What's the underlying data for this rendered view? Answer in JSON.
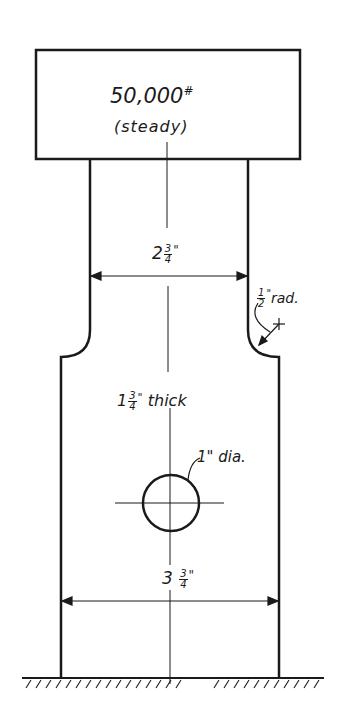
{
  "diagram": {
    "type": "engineering-drawing",
    "colors": {
      "ink": "#1a1a1a",
      "background": "#ffffff"
    },
    "load_box": {
      "load": "50,000",
      "load_unit": "#",
      "condition": "(steady)"
    },
    "upper_width": {
      "whole": "2",
      "num": "3",
      "den": "4",
      "unit": "\""
    },
    "fillet_radius": {
      "num": "1",
      "den": "2",
      "unit": "\"",
      "suffix": "rad.",
      "open_paren": "("
    },
    "thickness": {
      "whole": "1",
      "num": "3",
      "den": "4",
      "unit": "\"",
      "suffix": "thick"
    },
    "hole": {
      "label": "1\" dia."
    },
    "lower_width": {
      "whole": "3",
      "num": "3",
      "den": "4",
      "unit": "\""
    },
    "support": "ground-fixed"
  }
}
